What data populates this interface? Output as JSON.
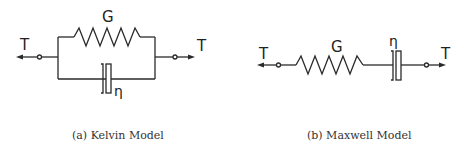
{
  "figure": {
    "stroke_color": "#2a2a2a",
    "background": "#ffffff"
  },
  "kelvin": {
    "spring_label": "G",
    "dashpot_label": "η",
    "force_left_label": "T",
    "force_right_label": "T",
    "caption": "(a)  Kelvin Model"
  },
  "maxwell": {
    "spring_label": "G",
    "dashpot_label": "η",
    "force_left_label": "T",
    "force_right_label": "T",
    "caption": "(b)  Maxwell Model"
  }
}
